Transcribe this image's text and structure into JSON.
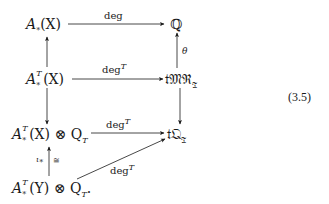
{
  "diagram": {
    "type": "commutative-diagram",
    "equation_number": "(3.5)",
    "nodes": {
      "a_x": {
        "base": "A",
        "sub": "*",
        "arg": "(X)"
      },
      "q": {
        "text": "ℚ"
      },
      "at_x": {
        "base": "A",
        "sub": "*",
        "sup": "T",
        "arg": "(X)"
      },
      "tmr": {
        "text": "𝔱𝔐ℜ",
        "sub": "𝔗"
      },
      "at_x_q": {
        "base": "A",
        "sub": "*",
        "sup": "T",
        "arg": "(X) ⊗ Q",
        "qsub": "T"
      },
      "tq": {
        "text": "𝔱𝔔",
        "sub": "𝔗"
      },
      "at_y_q": {
        "base": "A",
        "sub": "*",
        "sup": "T",
        "arg": "(Y) ⊗ Q",
        "qsub": "T",
        "trail": "."
      }
    },
    "arrows": [
      {
        "from": "a_x",
        "to": "q",
        "label": "deg"
      },
      {
        "from": "at_x",
        "to": "a_x",
        "label": ""
      },
      {
        "from": "at_x",
        "to": "tmr",
        "label": "deg",
        "label_sup": "T"
      },
      {
        "from": "tmr",
        "to": "q",
        "label": "θ"
      },
      {
        "from": "at_x",
        "to": "at_x_q",
        "label": ""
      },
      {
        "from": "tmr",
        "to": "tq",
        "label": ""
      },
      {
        "from": "at_x_q",
        "to": "tq",
        "label": "deg",
        "label_sup": "T"
      },
      {
        "from": "at_y_q",
        "to": "at_x_q",
        "label_left": "ι",
        "label_left_sub": "*",
        "label_right": "≅"
      },
      {
        "from": "at_y_q",
        "to": "tq",
        "label": "deg",
        "label_sup": "T"
      }
    ]
  }
}
